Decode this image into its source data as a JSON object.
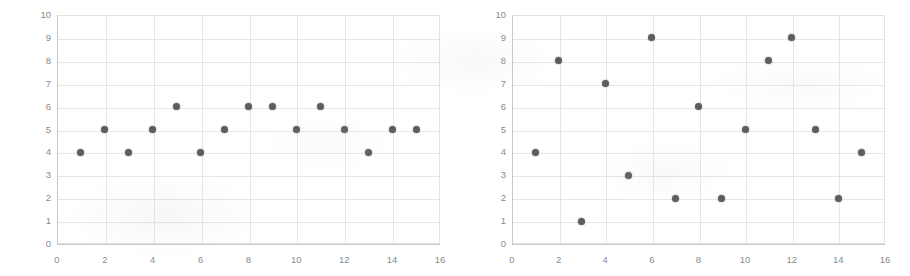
{
  "figure": {
    "background_color": "#ffffff",
    "marker_color": "#5d5d5d",
    "gridline_color": "#e6e6e6",
    "axis_color": "#c9c9c9",
    "tick_label_color": "#8a8a8a"
  },
  "chart_data": [
    {
      "type": "scatter",
      "name": "left-scatter-plot",
      "title": "",
      "xlabel": "",
      "ylabel": "",
      "xlim": [
        0,
        16
      ],
      "ylim": [
        0,
        10
      ],
      "grid": true,
      "legend": "none",
      "xticks": [
        "0",
        "2",
        "4",
        "6",
        "8",
        "10",
        "12",
        "14",
        "16"
      ],
      "xtick_values": [
        0,
        2,
        4,
        6,
        8,
        10,
        12,
        14,
        16
      ],
      "yticks": [
        "0",
        "1",
        "2",
        "3",
        "4",
        "5",
        "6",
        "7",
        "8",
        "9",
        "10"
      ],
      "ytick_values": [
        0,
        1,
        2,
        3,
        4,
        5,
        6,
        7,
        8,
        9,
        10
      ],
      "x": [
        1,
        2,
        3,
        4,
        5,
        6,
        7,
        8,
        9,
        10,
        11,
        12,
        13,
        14,
        15
      ],
      "values": [
        4,
        5,
        4,
        5,
        6,
        4,
        5,
        6,
        6,
        5,
        6,
        5,
        4,
        5,
        5
      ],
      "points": [
        {
          "x": 1,
          "y": 4
        },
        {
          "x": 2,
          "y": 5
        },
        {
          "x": 3,
          "y": 4
        },
        {
          "x": 4,
          "y": 5
        },
        {
          "x": 5,
          "y": 6
        },
        {
          "x": 6,
          "y": 4
        },
        {
          "x": 7,
          "y": 5
        },
        {
          "x": 8,
          "y": 6
        },
        {
          "x": 9,
          "y": 6
        },
        {
          "x": 10,
          "y": 5
        },
        {
          "x": 11,
          "y": 6
        },
        {
          "x": 12,
          "y": 5
        },
        {
          "x": 13,
          "y": 4
        },
        {
          "x": 14,
          "y": 5
        },
        {
          "x": 15,
          "y": 5
        }
      ]
    },
    {
      "type": "scatter",
      "name": "right-scatter-plot",
      "title": "",
      "xlabel": "",
      "ylabel": "",
      "xlim": [
        0,
        16
      ],
      "ylim": [
        0,
        10
      ],
      "grid": true,
      "legend": "none",
      "xticks": [
        "0",
        "2",
        "4",
        "6",
        "8",
        "10",
        "12",
        "14",
        "16"
      ],
      "xtick_values": [
        0,
        2,
        4,
        6,
        8,
        10,
        12,
        14,
        16
      ],
      "yticks": [
        "0",
        "1",
        "2",
        "3",
        "4",
        "5",
        "6",
        "7",
        "8",
        "9",
        "10"
      ],
      "ytick_values": [
        0,
        1,
        2,
        3,
        4,
        5,
        6,
        7,
        8,
        9,
        10
      ],
      "x": [
        1,
        2,
        3,
        4,
        5,
        6,
        7,
        8,
        9,
        10,
        11,
        12,
        13,
        14,
        15
      ],
      "values": [
        4,
        8,
        1,
        7,
        3,
        9,
        2,
        6,
        2,
        5,
        8,
        9,
        5,
        2,
        4
      ],
      "points": [
        {
          "x": 1,
          "y": 4
        },
        {
          "x": 2,
          "y": 8
        },
        {
          "x": 3,
          "y": 1
        },
        {
          "x": 4,
          "y": 7
        },
        {
          "x": 5,
          "y": 3
        },
        {
          "x": 6,
          "y": 9
        },
        {
          "x": 7,
          "y": 2
        },
        {
          "x": 8,
          "y": 6
        },
        {
          "x": 9,
          "y": 2
        },
        {
          "x": 10,
          "y": 5
        },
        {
          "x": 11,
          "y": 8
        },
        {
          "x": 12,
          "y": 9
        },
        {
          "x": 13,
          "y": 5
        },
        {
          "x": 14,
          "y": 2
        },
        {
          "x": 15,
          "y": 4
        }
      ]
    }
  ]
}
